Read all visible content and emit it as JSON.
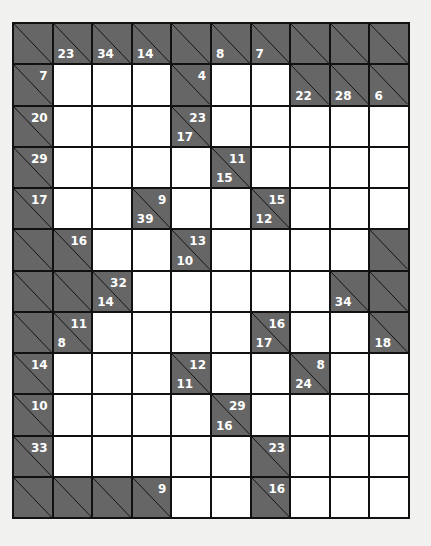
{
  "puzzle": {
    "type": "kakuro",
    "cols": 10,
    "rows": 12,
    "colors": {
      "clue_bg": "#666666",
      "white_cell": "#ffffff",
      "grid_line": "#111111",
      "page_bg": "#f1f1ef"
    },
    "grid": [
      [
        {
          "t": "B"
        },
        {
          "t": "C",
          "d": "23"
        },
        {
          "t": "C",
          "d": "34"
        },
        {
          "t": "C",
          "d": "14"
        },
        {
          "t": "B"
        },
        {
          "t": "C",
          "d": "8"
        },
        {
          "t": "C",
          "d": "7"
        },
        {
          "t": "B"
        },
        {
          "t": "B"
        },
        {
          "t": "B"
        }
      ],
      [
        {
          "t": "C",
          "r": "7"
        },
        {
          "t": "W"
        },
        {
          "t": "W"
        },
        {
          "t": "W"
        },
        {
          "t": "C",
          "r": "4"
        },
        {
          "t": "W"
        },
        {
          "t": "W"
        },
        {
          "t": "C",
          "d": "22"
        },
        {
          "t": "C",
          "d": "28"
        },
        {
          "t": "C",
          "d": "6"
        }
      ],
      [
        {
          "t": "C",
          "r": "20"
        },
        {
          "t": "W"
        },
        {
          "t": "W"
        },
        {
          "t": "W"
        },
        {
          "t": "C",
          "d": "17",
          "r": "23"
        },
        {
          "t": "W"
        },
        {
          "t": "W"
        },
        {
          "t": "W"
        },
        {
          "t": "W"
        },
        {
          "t": "W"
        }
      ],
      [
        {
          "t": "C",
          "r": "29"
        },
        {
          "t": "W"
        },
        {
          "t": "W"
        },
        {
          "t": "W"
        },
        {
          "t": "W"
        },
        {
          "t": "C",
          "d": "15",
          "r": "11"
        },
        {
          "t": "W"
        },
        {
          "t": "W"
        },
        {
          "t": "W"
        },
        {
          "t": "W"
        }
      ],
      [
        {
          "t": "C",
          "r": "17"
        },
        {
          "t": "W"
        },
        {
          "t": "W"
        },
        {
          "t": "C",
          "d": "39",
          "r": "9"
        },
        {
          "t": "W"
        },
        {
          "t": "W"
        },
        {
          "t": "C",
          "d": "12",
          "r": "15"
        },
        {
          "t": "W"
        },
        {
          "t": "W"
        },
        {
          "t": "W"
        }
      ],
      [
        {
          "t": "B"
        },
        {
          "t": "C",
          "r": "16"
        },
        {
          "t": "W"
        },
        {
          "t": "W"
        },
        {
          "t": "C",
          "d": "10",
          "r": "13"
        },
        {
          "t": "W"
        },
        {
          "t": "W"
        },
        {
          "t": "W"
        },
        {
          "t": "W"
        },
        {
          "t": "B"
        }
      ],
      [
        {
          "t": "B"
        },
        {
          "t": "B"
        },
        {
          "t": "C",
          "d": "14",
          "r": "32"
        },
        {
          "t": "W"
        },
        {
          "t": "W"
        },
        {
          "t": "W"
        },
        {
          "t": "W"
        },
        {
          "t": "W"
        },
        {
          "t": "C",
          "d": "34"
        },
        {
          "t": "B"
        }
      ],
      [
        {
          "t": "B"
        },
        {
          "t": "C",
          "d": "8",
          "r": "11"
        },
        {
          "t": "W"
        },
        {
          "t": "W"
        },
        {
          "t": "W"
        },
        {
          "t": "W"
        },
        {
          "t": "C",
          "d": "17",
          "r": "16"
        },
        {
          "t": "W"
        },
        {
          "t": "W"
        },
        {
          "t": "C",
          "d": "18"
        }
      ],
      [
        {
          "t": "C",
          "r": "14"
        },
        {
          "t": "W"
        },
        {
          "t": "W"
        },
        {
          "t": "W"
        },
        {
          "t": "C",
          "d": "11",
          "r": "12"
        },
        {
          "t": "W"
        },
        {
          "t": "W"
        },
        {
          "t": "C",
          "d": "24",
          "r": "8"
        },
        {
          "t": "W"
        },
        {
          "t": "W"
        }
      ],
      [
        {
          "t": "C",
          "r": "10"
        },
        {
          "t": "W"
        },
        {
          "t": "W"
        },
        {
          "t": "W"
        },
        {
          "t": "W"
        },
        {
          "t": "C",
          "d": "16",
          "r": "29"
        },
        {
          "t": "W"
        },
        {
          "t": "W"
        },
        {
          "t": "W"
        },
        {
          "t": "W"
        }
      ],
      [
        {
          "t": "C",
          "r": "33"
        },
        {
          "t": "W"
        },
        {
          "t": "W"
        },
        {
          "t": "W"
        },
        {
          "t": "W"
        },
        {
          "t": "W"
        },
        {
          "t": "C",
          "r": "23"
        },
        {
          "t": "W"
        },
        {
          "t": "W"
        },
        {
          "t": "W"
        }
      ],
      [
        {
          "t": "B"
        },
        {
          "t": "B"
        },
        {
          "t": "B"
        },
        {
          "t": "C",
          "r": "9"
        },
        {
          "t": "W"
        },
        {
          "t": "W"
        },
        {
          "t": "C",
          "r": "16"
        },
        {
          "t": "W"
        },
        {
          "t": "W"
        },
        {
          "t": "W"
        }
      ]
    ]
  }
}
